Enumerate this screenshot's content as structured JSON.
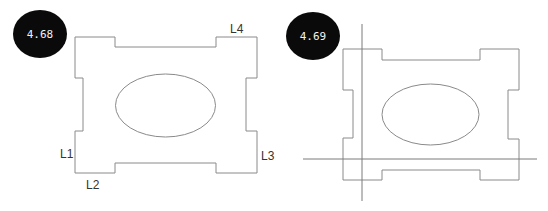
{
  "figures": [
    {
      "badge": {
        "label": "4.68",
        "cx": 40,
        "cy": 34,
        "rx": 27,
        "ry": 24
      },
      "outline_points": "75,37 115,37 115,47 216,47 216,37 257,37 257,78 246,78 246,131 257,131 257,173 216,173 216,163 115,163 115,173 75,173 75,131 83,131 83,78 75,78",
      "hole": {
        "cx": 165.5,
        "cy": 105.5,
        "rx": 50,
        "ry": 31.5
      },
      "edge_labels": [
        {
          "text": "L1",
          "x": 60,
          "y": 158
        },
        {
          "text": "L2",
          "x": 86,
          "y": 189
        },
        {
          "text": "L3",
          "x": 261,
          "y": 160
        },
        {
          "text": "L4",
          "x": 230,
          "y": 33
        }
      ]
    },
    {
      "badge": {
        "label": "4.69",
        "cx": 313,
        "cy": 36,
        "rx": 27,
        "ry": 24
      },
      "outline_points": "343,49 382,49 382,60 480,60 480,49 519,49 519,90 508,90 508,139 519,139 519,180 480,180 480,170 382,170 382,180 343,180 343,138 353,138 353,90 343,90",
      "hole": {
        "cx": 430.5,
        "cy": 114.5,
        "rx": 48.5,
        "ry": 30.5
      },
      "guide_lines": {
        "vertical": {
          "x1": 362,
          "y1": 24,
          "x2": 362,
          "y2": 201
        },
        "horizontal": {
          "x1": 303,
          "y1": 159,
          "x2": 537,
          "y2": 159
        }
      }
    }
  ],
  "colors": {
    "line": "#8a8a8a",
    "badge": "#0a0a0a",
    "badge_text": "#f2f2f2"
  }
}
